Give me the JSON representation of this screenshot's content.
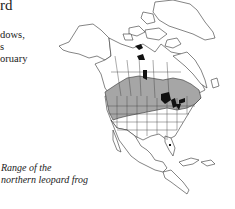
{
  "page": {
    "heading_fragment": "rd",
    "body_fragments": [
      "dows,",
      "s",
      "oruary"
    ]
  },
  "map": {
    "title": "Range of the northern leopard frog",
    "caption_lines": [
      "Range of the",
      "northern leopard frog"
    ],
    "region": "North America",
    "legend": {
      "range_fill": "#a6a6a6",
      "lakes_fill": "#111111",
      "land_fill": "#ffffff",
      "outline": "#333333"
    },
    "range_description": "Southern Canada and northern/central United States, shaded grey"
  }
}
